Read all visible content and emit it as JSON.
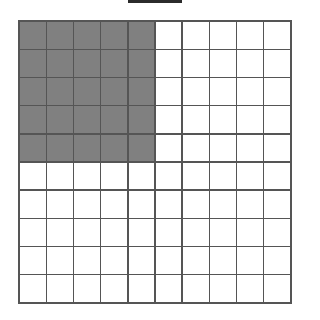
{
  "figure": {
    "type": "area-model-grid",
    "title_bar": {
      "present": true,
      "description": "cropped-dark-bar",
      "color": "#2b2b2b"
    }
  },
  "grid": {
    "rows": 10,
    "columns": 10,
    "total_cells": 100,
    "shaded_cells": 25,
    "unshaded_cells": 75,
    "shaded_region": {
      "shape": "rectangle",
      "anchor": "top-left",
      "rows": 5,
      "columns": 5
    },
    "fraction_shaded": "25/100",
    "simplified_fraction": "1/4",
    "percent_shaded": "25%",
    "decimal_shaded": "0.25"
  },
  "colors": {
    "shaded_fill": "#808080",
    "unshaded_fill": "#ffffff",
    "gridline": "#555555",
    "border": "#555555",
    "background": "#ffffff",
    "top_bar": "#2b2b2b"
  },
  "chart_data": {
    "type": "heatmap",
    "title": "",
    "xlabel": "",
    "ylabel": "",
    "rows": 10,
    "columns": 10,
    "legend": [
      {
        "label": "shaded",
        "value": 1,
        "color": "#808080"
      },
      {
        "label": "unshaded",
        "value": 0,
        "color": "#ffffff"
      }
    ],
    "values": [
      [
        1,
        1,
        1,
        1,
        1,
        0,
        0,
        0,
        0,
        0
      ],
      [
        1,
        1,
        1,
        1,
        1,
        0,
        0,
        0,
        0,
        0
      ],
      [
        1,
        1,
        1,
        1,
        1,
        0,
        0,
        0,
        0,
        0
      ],
      [
        1,
        1,
        1,
        1,
        1,
        0,
        0,
        0,
        0,
        0
      ],
      [
        1,
        1,
        1,
        1,
        1,
        0,
        0,
        0,
        0,
        0
      ],
      [
        0,
        0,
        0,
        0,
        0,
        0,
        0,
        0,
        0,
        0
      ],
      [
        0,
        0,
        0,
        0,
        0,
        0,
        0,
        0,
        0,
        0
      ],
      [
        0,
        0,
        0,
        0,
        0,
        0,
        0,
        0,
        0,
        0
      ],
      [
        0,
        0,
        0,
        0,
        0,
        0,
        0,
        0,
        0,
        0
      ],
      [
        0,
        0,
        0,
        0,
        0,
        0,
        0,
        0,
        0,
        0
      ]
    ]
  }
}
